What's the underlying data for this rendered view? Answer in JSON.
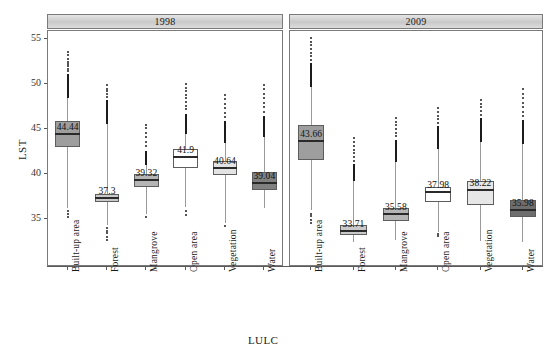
{
  "chart_data": {
    "type": "box",
    "title": "",
    "xlabel": "LULC",
    "ylabel": "LST",
    "ylim": [
      32,
      57
    ],
    "yticks": [
      35,
      40,
      45,
      50,
      55
    ],
    "grid": false,
    "legend": "none",
    "panels": [
      {
        "label": "1998",
        "categories": [
          "Built-up area",
          "Forest",
          "Mangrove",
          "Open area",
          "Vegetation",
          "Water"
        ],
        "boxes": [
          {
            "category": "Built-up area",
            "median": 44.44,
            "label": "44.44",
            "q1": 43.0,
            "q3": 45.9,
            "lower": 36.2,
            "upper": 51.1,
            "fill": "#9e9e9e",
            "outliers": [
              51.4,
              51.7,
              52.0,
              52.2,
              52.5,
              52.8,
              53.2,
              53.6,
              35.9,
              35.6,
              35.2
            ]
          },
          {
            "category": "Forest",
            "median": 37.3,
            "label": "37.3",
            "q1": 36.9,
            "q3": 37.8,
            "lower": 34.3,
            "upper": 48.2,
            "fill": "#c9c9c9",
            "outliers": [
              48.6,
              48.9,
              49.2,
              49.5,
              49.9,
              34.0,
              33.7,
              33.4,
              33.0,
              32.7
            ]
          },
          {
            "category": "Mangrove",
            "median": 39.32,
            "label": "39.32",
            "q1": 38.6,
            "q3": 40.0,
            "lower": 35.5,
            "upper": 42.6,
            "fill": "#b5b5b5",
            "outliers": [
              43.1,
              43.6,
              44.1,
              44.6,
              45.1,
              45.5,
              35.2
            ]
          },
          {
            "category": "Open area",
            "median": 41.9,
            "label": "41.9",
            "q1": 40.7,
            "q3": 42.8,
            "lower": 36.3,
            "upper": 46.7,
            "fill": "#ffffff",
            "outliers": [
              47.2,
              47.6,
              48.0,
              48.4,
              48.8,
              49.2,
              49.6,
              50.0,
              35.9,
              35.5
            ]
          },
          {
            "category": "Vegetation",
            "median": 40.64,
            "label": "40.64",
            "q1": 39.9,
            "q3": 41.5,
            "lower": 34.6,
            "upper": 45.9,
            "fill": "#e3e3e3",
            "outliers": [
              46.3,
              46.8,
              47.3,
              47.8,
              48.3,
              48.8,
              34.2
            ]
          },
          {
            "category": "Water",
            "median": 39.04,
            "label": "39.04",
            "q1": 38.2,
            "q3": 40.2,
            "lower": 36.2,
            "upper": 46.4,
            "fill": "#808080",
            "outliers": [
              46.9,
              47.4,
              47.9,
              48.4,
              48.9,
              49.4,
              49.9
            ]
          }
        ]
      },
      {
        "label": "2009",
        "categories": [
          "Built-up area",
          "Forest",
          "Mangrove",
          "Open area",
          "Vegetation",
          "Water"
        ],
        "boxes": [
          {
            "category": "Built-up area",
            "median": 43.66,
            "label": "43.66",
            "q1": 41.6,
            "q3": 45.4,
            "lower": 36.0,
            "upper": 52.3,
            "fill": "#9e9e9e",
            "outliers": [
              52.7,
              53.1,
              53.5,
              53.9,
              54.3,
              54.7,
              55.1,
              35.6,
              35.3,
              34.9,
              34.6
            ]
          },
          {
            "category": "Forest",
            "median": 33.71,
            "label": "33.71",
            "q1": 33.2,
            "q3": 34.3,
            "lower": 32.4,
            "upper": 41.1,
            "fill": "#c9c9c9",
            "outliers": [
              41.5,
              41.9,
              42.3,
              42.7,
              43.1,
              43.6,
              44.0
            ]
          },
          {
            "category": "Mangrove",
            "median": 35.58,
            "label": "35.58",
            "q1": 34.8,
            "q3": 36.2,
            "lower": 32.7,
            "upper": 43.8,
            "fill": "#b5b5b5",
            "outliers": [
              44.2,
              44.6,
              45.0,
              45.4,
              45.8,
              46.2
            ]
          },
          {
            "category": "Open area",
            "median": 37.98,
            "label": "37.98",
            "q1": 36.9,
            "q3": 38.6,
            "lower": 33.6,
            "upper": 45.3,
            "fill": "#ffffff",
            "outliers": [
              45.7,
              46.1,
              46.5,
              46.9,
              47.3,
              33.3,
              33.1
            ]
          },
          {
            "category": "Vegetation",
            "median": 38.22,
            "label": "38.22",
            "q1": 36.6,
            "q3": 39.2,
            "lower": 32.5,
            "upper": 46.2,
            "fill": "#e7e7e7",
            "outliers": [
              46.6,
              47.0,
              47.4,
              47.8,
              48.2
            ]
          },
          {
            "category": "Water",
            "median": 35.98,
            "label": "35.98",
            "q1": 35.2,
            "q3": 37.1,
            "lower": 32.5,
            "upper": 46.0,
            "fill": "#6e6e6e",
            "outliers": [
              46.4,
              46.9,
              47.4,
              47.9,
              48.4,
              48.9,
              49.4
            ]
          }
        ]
      }
    ]
  }
}
